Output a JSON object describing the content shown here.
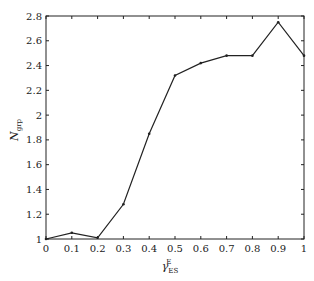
{
  "chart_data": {
    "type": "line",
    "title": "",
    "xlabel": "γ_ES^E",
    "xlabel_main": "γ",
    "xlabel_sub": "ES",
    "xlabel_sup": "E",
    "ylabel": "N_grp",
    "ylabel_main": "N",
    "ylabel_sub": "grp",
    "xlim": [
      0,
      1
    ],
    "ylim": [
      1,
      2.8
    ],
    "grid": false,
    "legend": null,
    "x_ticks": [
      "0",
      "0.1",
      "0.2",
      "0.3",
      "0.4",
      "0.5",
      "0.6",
      "0.7",
      "0.8",
      "0.9",
      "1"
    ],
    "y_ticks": [
      "1",
      "1.2",
      "1.4",
      "1.6",
      "1.8",
      "2",
      "2.2",
      "2.4",
      "2.6",
      "2.8"
    ],
    "x": [
      0,
      0.1,
      0.2,
      0.3,
      0.4,
      0.5,
      0.6,
      0.7,
      0.8,
      0.9,
      1.0
    ],
    "series": [
      {
        "name": "N_grp",
        "values": [
          1.0,
          1.05,
          1.01,
          1.28,
          1.85,
          2.32,
          2.42,
          2.48,
          2.48,
          2.75,
          2.48
        ],
        "color": "#222222"
      }
    ]
  }
}
